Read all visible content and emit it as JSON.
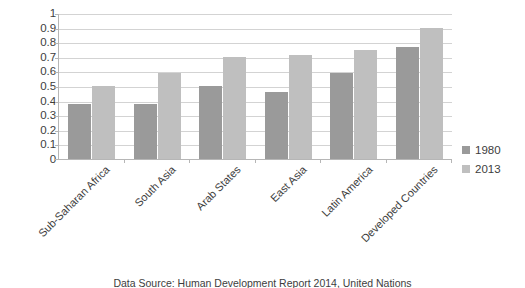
{
  "chart_data": {
    "type": "bar",
    "title": "",
    "subtitle": "",
    "xlabel": "",
    "ylabel": "",
    "ylim": [
      0,
      1
    ],
    "y_ticks": [
      "0",
      "0.1",
      "0.2",
      "0.3",
      "0.4",
      "0.5",
      "0.6",
      "0.7",
      "0.8",
      "0.9",
      "1"
    ],
    "y_tick_values": [
      0,
      0.1,
      0.2,
      0.3,
      0.4,
      0.5,
      0.6,
      0.7,
      0.8,
      0.9,
      1
    ],
    "grid": true,
    "legend_position": "right",
    "categories": [
      "Sub-Saharan Africa",
      "South Asia",
      "Arab States",
      "East Asia",
      "Latin America",
      "Developed Countries"
    ],
    "series": [
      {
        "name": "1980",
        "color": "#9a9a9a",
        "values": [
          0.38,
          0.38,
          0.5,
          0.46,
          0.59,
          0.77
        ]
      },
      {
        "name": "2013",
        "color": "#bfbfbf",
        "values": [
          0.5,
          0.59,
          0.7,
          0.71,
          0.75,
          0.9
        ]
      }
    ]
  },
  "legend": {
    "items": [
      {
        "label": "1980",
        "swatch": "series-0"
      },
      {
        "label": "2013",
        "swatch": "series-1"
      }
    ]
  },
  "caption": {
    "text": "Data Source: Human Development Report 2014, United Nations"
  }
}
